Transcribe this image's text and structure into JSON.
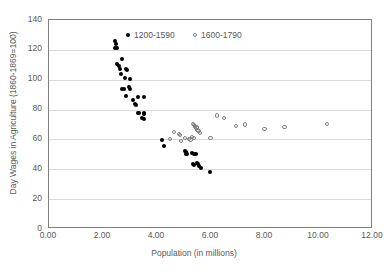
{
  "chart_data": {
    "type": "scatter",
    "title": "",
    "xlabel": "Population (in millions)",
    "ylabel": "Day Wages in Agriculture (1860-1869=100)",
    "xlim": [
      0,
      12
    ],
    "ylim": [
      0,
      140
    ],
    "xticks": [
      "0.00",
      "2.00",
      "4.00",
      "6.00",
      "8.00",
      "10.00",
      "12.00"
    ],
    "xtick_values": [
      0,
      2,
      4,
      6,
      8,
      10,
      12
    ],
    "yticks": [
      "0",
      "20",
      "40",
      "60",
      "80",
      "100",
      "120",
      "140"
    ],
    "ytick_values": [
      0,
      20,
      40,
      60,
      80,
      100,
      120,
      140
    ],
    "grid": "horizontal",
    "legend_position": "top-center",
    "series": [
      {
        "name": "1200-1590",
        "marker": "filled-circle",
        "color": "#000000",
        "points": [
          [
            2.45,
            126.0
          ],
          [
            2.47,
            124.0
          ],
          [
            2.46,
            121.5
          ],
          [
            2.5,
            121.0
          ],
          [
            2.52,
            110.5
          ],
          [
            2.58,
            109.5
          ],
          [
            2.7,
            114.0
          ],
          [
            2.62,
            107.0
          ],
          [
            2.66,
            104.0
          ],
          [
            2.85,
            107.0
          ],
          [
            2.88,
            106.5
          ],
          [
            2.8,
            101.0
          ],
          [
            3.0,
            100.5
          ],
          [
            2.72,
            94.0
          ],
          [
            2.78,
            93.5
          ],
          [
            2.95,
            95.0
          ],
          [
            3.0,
            94.0
          ],
          [
            2.86,
            89.0
          ],
          [
            3.3,
            88.5
          ],
          [
            3.52,
            88.5
          ],
          [
            3.1,
            86.5
          ],
          [
            3.18,
            84.0
          ],
          [
            3.22,
            83.0
          ],
          [
            3.3,
            78.0
          ],
          [
            3.34,
            77.5
          ],
          [
            3.5,
            78.0
          ],
          [
            3.52,
            77.0
          ],
          [
            3.44,
            74.5
          ],
          [
            3.5,
            73.5
          ],
          [
            4.18,
            59.5
          ],
          [
            4.25,
            55.5
          ],
          [
            5.02,
            52.0
          ],
          [
            5.06,
            51.5
          ],
          [
            5.08,
            50.5
          ],
          [
            5.12,
            50.5
          ],
          [
            5.3,
            51.0
          ],
          [
            5.36,
            50.5
          ],
          [
            5.44,
            50.5
          ],
          [
            5.32,
            43.5
          ],
          [
            5.38,
            43.0
          ],
          [
            5.48,
            44.5
          ],
          [
            5.52,
            43.5
          ],
          [
            5.56,
            42.0
          ],
          [
            5.62,
            41.0
          ],
          [
            5.98,
            38.5
          ]
        ]
      },
      {
        "name": "1600-1790",
        "marker": "open-circle",
        "color": "#7f7f7f",
        "points": [
          [
            4.62,
            65.0
          ],
          [
            4.48,
            60.5
          ],
          [
            4.8,
            63.5
          ],
          [
            4.86,
            63.0
          ],
          [
            4.9,
            59.0
          ],
          [
            5.04,
            61.0
          ],
          [
            5.2,
            60.5
          ],
          [
            5.24,
            60.0
          ],
          [
            5.3,
            61.5
          ],
          [
            5.38,
            61.0
          ],
          [
            5.34,
            70.5
          ],
          [
            5.38,
            69.5
          ],
          [
            5.42,
            68.5
          ],
          [
            5.46,
            67.5
          ],
          [
            5.5,
            66.5
          ],
          [
            5.54,
            65.5
          ],
          [
            5.58,
            64.5
          ],
          [
            5.42,
            69.0
          ],
          [
            5.46,
            68.0
          ],
          [
            5.98,
            61.0
          ],
          [
            6.22,
            76.0
          ],
          [
            6.48,
            74.5
          ],
          [
            6.92,
            69.0
          ],
          [
            7.26,
            70.0
          ],
          [
            7.98,
            67.0
          ],
          [
            8.72,
            68.5
          ],
          [
            10.3,
            70.5
          ]
        ]
      }
    ]
  }
}
